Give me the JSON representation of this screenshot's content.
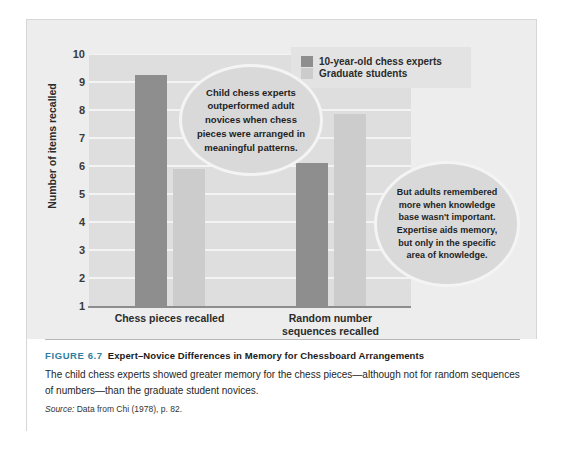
{
  "figure": {
    "number_label": "FIGURE 6.7",
    "title": "Expert–Novice Differences in Memory for Chessboard Arrangements",
    "body": "The child chess experts showed greater memory for the chess pieces—although not for random sequences of numbers—than the graduate student novices.",
    "source_label": "Source:",
    "source_text": "Data from Chi (1978), p. 82.",
    "accent_color": "#2f7f9e"
  },
  "legend": {
    "items": [
      {
        "label": "10-year-old chess experts",
        "color": "#8e8e8e"
      },
      {
        "label": "Graduate students",
        "color": "#cccccc"
      }
    ]
  },
  "callouts": {
    "left": "Child chess experts outperformed adult novices when chess pieces were arranged in meaningful patterns.",
    "right": "But adults remembered more when knowledge base wasn't important. Expertise aids memory, but only in the specific area of knowledge."
  },
  "chart_data": {
    "type": "bar",
    "title": "Expert–Novice Differences in Memory for Chessboard Arrangements",
    "xlabel": "",
    "ylabel": "Number of items recalled",
    "categories": [
      "Chess pieces recalled",
      "Random number sequences recalled"
    ],
    "series": [
      {
        "name": "10-year-old chess experts",
        "color": "#8e8e8e",
        "values": [
          9.25,
          6.1
        ]
      },
      {
        "name": "Graduate students",
        "color": "#cccccc",
        "values": [
          5.9,
          7.85
        ]
      }
    ],
    "ylim": [
      1,
      10
    ],
    "yticks": [
      1,
      2,
      3,
      4,
      5,
      6,
      7,
      8,
      9,
      10
    ],
    "ytick_labels": [
      "1",
      "2",
      "3",
      "4",
      "5",
      "6",
      "7",
      "8",
      "9",
      "10"
    ],
    "grid": true,
    "grid_color": "#f3f3f3",
    "plot_background": "#dedede",
    "legend_position": "top-right"
  }
}
